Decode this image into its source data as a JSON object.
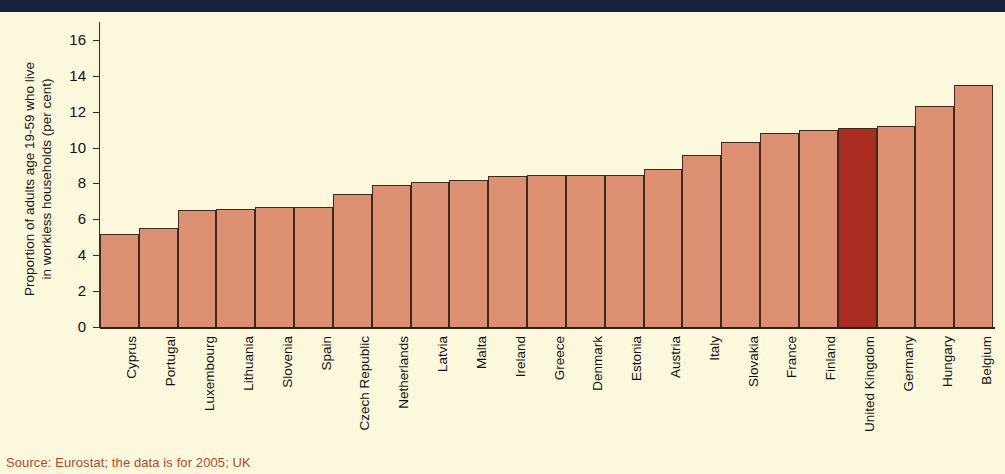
{
  "figure": {
    "background_color": "#fbf8dc",
    "header_band_color": "#18203f",
    "source_note": "Source: Eurostat; the data is for 2005; UK"
  },
  "chart_data": {
    "type": "bar",
    "title": "",
    "xlabel": "",
    "ylabel": "Proportion of adults age 19-59 who live\nin workless households (per cent)",
    "ylim": [
      0,
      17
    ],
    "yticks": [
      0,
      2,
      4,
      6,
      8,
      10,
      12,
      14,
      16
    ],
    "ytick_labels": [
      "0",
      "2",
      "4",
      "6",
      "8",
      "10",
      "12",
      "14",
      "16"
    ],
    "grid": false,
    "legend": "none",
    "bar_color": "#dd8f72",
    "highlight_color": "#ab2c21",
    "highlight_category": "United Kingdom",
    "categories": [
      "Cyprus",
      "Portugal",
      "Luxembourg",
      "Lithuania",
      "Slovenia",
      "Spain",
      "Czech Republic",
      "Netherlands",
      "Latvia",
      "Malta",
      "Ireland",
      "Greece",
      "Denmark",
      "Estonia",
      "Austria",
      "Italy",
      "Slovakia",
      "France",
      "Finland",
      "United Kingdom",
      "Germany",
      "Hungary",
      "Belgium"
    ],
    "values": [
      5.2,
      5.5,
      6.5,
      6.6,
      6.7,
      6.7,
      7.4,
      7.9,
      8.1,
      8.2,
      8.4,
      8.5,
      8.5,
      8.5,
      8.8,
      9.6,
      10.3,
      10.8,
      11.0,
      11.1,
      11.2,
      12.3,
      13.5
    ]
  }
}
